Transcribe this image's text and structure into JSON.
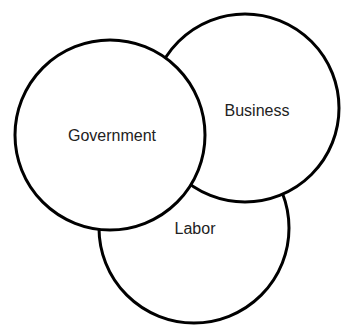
{
  "diagram": {
    "type": "venn",
    "stroke_color": "#000000",
    "fill_color": "#ffffff",
    "circles": [
      {
        "id": "labor",
        "label": "Labor",
        "cx": 194,
        "cy": 228,
        "r": 95,
        "label_x": 195,
        "label_y": 234
      },
      {
        "id": "business",
        "label": "Business",
        "cx": 245,
        "cy": 108,
        "r": 94,
        "label_x": 257,
        "label_y": 116
      },
      {
        "id": "government",
        "label": "Government",
        "cx": 110,
        "cy": 135,
        "r": 95,
        "label_x": 112,
        "label_y": 141
      }
    ]
  }
}
